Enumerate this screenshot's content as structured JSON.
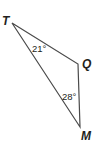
{
  "diagram": {
    "type": "triangle",
    "vertices": [
      {
        "name": "T",
        "x": 12,
        "y": 23
      },
      {
        "name": "Q",
        "x": 78,
        "y": 64
      },
      {
        "name": "M",
        "x": 80,
        "y": 127
      }
    ],
    "labels": {
      "T": "T",
      "Q": "Q",
      "M": "M"
    },
    "angles": [
      {
        "vertex": "T",
        "text": "21°"
      },
      {
        "vertex": "M",
        "text": "28°"
      }
    ],
    "stroke_color": "#4a4a4a",
    "text_color": "#231f20"
  }
}
